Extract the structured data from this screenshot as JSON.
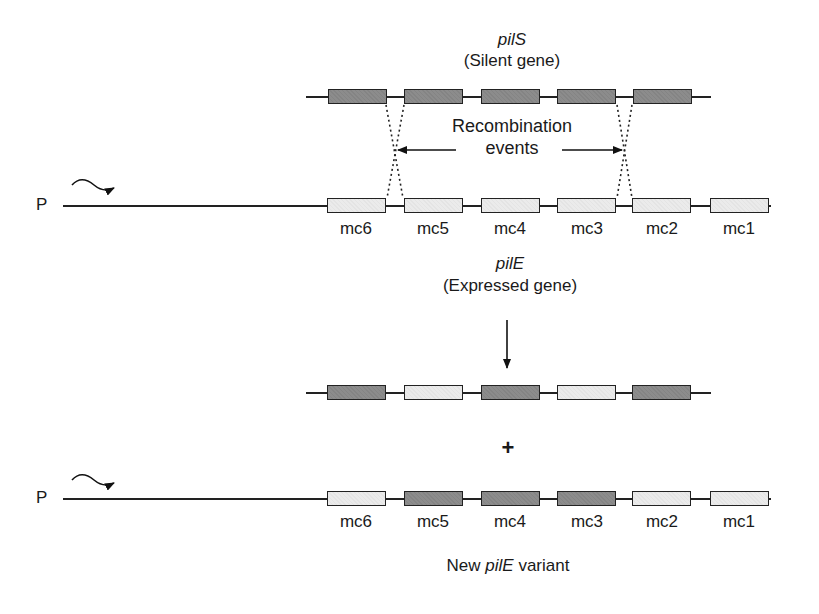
{
  "diagram": {
    "silent_gene": {
      "name": "pilS",
      "subtitle": "(Silent gene)",
      "boxes": [
        "dark",
        "dark",
        "dark",
        "dark",
        "dark"
      ]
    },
    "recombination": {
      "label_line1": "Recombination",
      "label_line2": "events"
    },
    "expressed_gene": {
      "promoter_label": "P",
      "name": "pilE",
      "subtitle": "(Expressed gene)",
      "boxes": [
        "light",
        "light",
        "light",
        "light",
        "light",
        "light"
      ],
      "labels": [
        "mc6",
        "mc5",
        "mc4",
        "mc3",
        "mc2",
        "mc1"
      ]
    },
    "product_silent": {
      "boxes": [
        "dark",
        "light",
        "dark",
        "light",
        "dark"
      ]
    },
    "plus_sign": "+",
    "new_variant": {
      "promoter_label": "P",
      "boxes": [
        "light",
        "dark",
        "dark",
        "dark",
        "light",
        "light"
      ],
      "labels": [
        "mc6",
        "mc5",
        "mc4",
        "mc3",
        "mc2",
        "mc1"
      ],
      "caption_prefix": "New ",
      "caption_gene": "pilE",
      "caption_suffix": " variant"
    },
    "colors": {
      "dark_box": "#8c8c8c",
      "light_box": "#ebebeb",
      "line": "#222222"
    }
  }
}
